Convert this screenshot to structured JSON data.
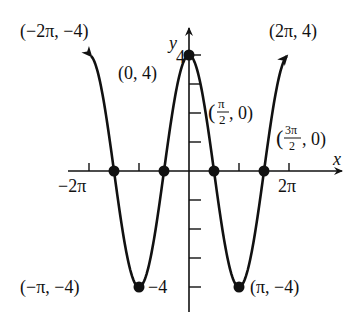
{
  "chart_data": {
    "type": "line",
    "title": "",
    "function": "y = 4 cos x",
    "xlabel": "x",
    "ylabel": "y",
    "xlim": [
      -6.9,
      6.9
    ],
    "ylim": [
      -4.8,
      5
    ],
    "grid": false,
    "legend": null,
    "x_tick_labels": [
      "-2π",
      "2π"
    ],
    "y_tick_labels": [
      "4",
      "-4"
    ],
    "series": [
      {
        "name": "4cos(x)",
        "x": [
          -6.28,
          -4.71,
          -3.14,
          -1.57,
          0,
          1.57,
          3.14,
          4.71,
          6.28
        ],
        "values": [
          4,
          0,
          -4,
          0,
          4,
          0,
          -4,
          0,
          4
        ]
      }
    ],
    "marked_points": [
      {
        "label": "(0, 4)",
        "x": 0,
        "y": 4
      },
      {
        "label": "(π/2, 0)",
        "x": 1.5708,
        "y": 0
      },
      {
        "label": "(3π/2, 0)",
        "x": 4.7124,
        "y": 0
      },
      {
        "label": "(-π/2, 0)",
        "x": -1.5708,
        "y": 0
      },
      {
        "label": "(-3π/2, 0)",
        "x": -4.7124,
        "y": 0
      },
      {
        "label": "(-π, -4)",
        "x": -3.1416,
        "y": -4
      },
      {
        "label": "(π, -4)",
        "x": 3.1416,
        "y": -4
      }
    ],
    "annotations": [
      {
        "text": "(−2π, −4)",
        "note": "label at upper-left arrow end"
      },
      {
        "text": "(2π, 4)",
        "note": "label at upper-right arrow end"
      }
    ]
  },
  "labels": {
    "x_axis": "x",
    "y_axis": "y",
    "neg_two_pi": "−2π",
    "two_pi": "2π",
    "y_four": "4",
    "y_neg_four": "−4",
    "pt_top_left": "(−2π, −4)",
    "pt_top_right": "(2π, 4)",
    "pt_max": "(0, 4)",
    "pt_half_pi_open": "(",
    "pt_half_pi_num": "π",
    "pt_half_pi_den": "2",
    "pt_half_pi_close": ", 0)",
    "pt_three_half_open": "(",
    "pt_three_half_num": "3π",
    "pt_three_half_den": "2",
    "pt_three_half_close": ", 0)",
    "pt_min_left": "(−π, −4)",
    "pt_min_right": "(π, −4)"
  }
}
